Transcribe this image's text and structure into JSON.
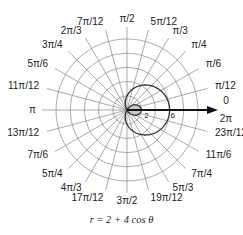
{
  "figure": {
    "formula": "r = 2 + 4 cos θ",
    "center": [
      127,
      110
    ],
    "ring_spacing_px": 14.2,
    "ring_values": [
      2,
      4,
      6,
      8,
      10
    ],
    "curve_color": "#333333",
    "grid_color": "#888888",
    "inner_loop_fill": "#c8c8c8",
    "axis_labels": {
      "zero": "0",
      "two_pi": "2π",
      "radius_2": "2",
      "radius_6": "6"
    },
    "angle_labels": [
      {
        "text": "π/12",
        "deg": 15
      },
      {
        "text": "π/6",
        "deg": 30
      },
      {
        "text": "π/4",
        "deg": 45
      },
      {
        "text": "π/3",
        "deg": 60
      },
      {
        "text": "5π/12",
        "deg": 75
      },
      {
        "text": "π/2",
        "deg": 90
      },
      {
        "text": "7π/12",
        "deg": 105
      },
      {
        "text": "2π/3",
        "deg": 120
      },
      {
        "text": "3π/4",
        "deg": 135
      },
      {
        "text": "5π/6",
        "deg": 150
      },
      {
        "text": "11π/12",
        "deg": 165
      },
      {
        "text": "π",
        "deg": 180
      },
      {
        "text": "13π/12",
        "deg": 195
      },
      {
        "text": "7π/6",
        "deg": 210
      },
      {
        "text": "5π/4",
        "deg": 225
      },
      {
        "text": "4π/3",
        "deg": 240
      },
      {
        "text": "17π/12",
        "deg": 255
      },
      {
        "text": "3π/2",
        "deg": 270
      },
      {
        "text": "19π/12",
        "deg": 285
      },
      {
        "text": "5π/3",
        "deg": 300
      },
      {
        "text": "7π/4",
        "deg": 315
      },
      {
        "text": "11π/6",
        "deg": 330
      },
      {
        "text": "23π/12",
        "deg": 345
      }
    ]
  }
}
